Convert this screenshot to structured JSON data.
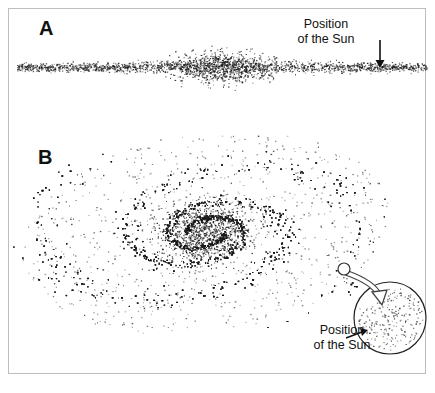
{
  "figure": {
    "panels": [
      {
        "id": "A",
        "label": "A",
        "view": "edge-on",
        "annotation": {
          "line1": "Position",
          "line2": "of the Sun"
        },
        "sun_arrow": {
          "x": 380,
          "y_start": 40,
          "y_end": 67
        }
      },
      {
        "id": "B",
        "label": "B",
        "view": "face-on",
        "annotation": {
          "line1": "Position",
          "line2": "of the Sun"
        },
        "sun_marker": {
          "cx": 344,
          "cy": 269,
          "r": 6
        },
        "inset_circle": {
          "cx": 390,
          "cy": 318,
          "r": 36
        }
      }
    ],
    "caption_partial": "",
    "colors": {
      "star": "#1a1a1a",
      "frame": "#bdbdbd",
      "text": "#111111"
    },
    "generation": {
      "edge": {
        "cx": 222,
        "cy": 67,
        "half_length": 205,
        "disk_count": 1700,
        "bulge_count": 700
      },
      "spiral": {
        "cx": 205,
        "cy": 232,
        "rx": 195,
        "ry": 105,
        "tilt_deg": -8,
        "arms": 2,
        "arm_count": 5200,
        "bulge_count": 1100,
        "halo_count": 900
      }
    }
  }
}
